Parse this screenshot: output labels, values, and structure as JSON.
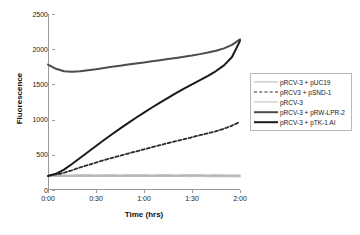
{
  "chart_data": {
    "type": "line",
    "title": "",
    "xlabel": "Time (hrs)",
    "ylabel": "Fluorescence",
    "xlim": [
      0,
      120
    ],
    "ylim": [
      0,
      2500
    ],
    "grid": false,
    "legend_position": "right",
    "xticks": [
      "0:00",
      "0:30",
      "1:00",
      "1:30",
      "2:00"
    ],
    "xtick_values": [
      0,
      30,
      60,
      90,
      120
    ],
    "yticks": [
      "0",
      "500",
      "1000",
      "1500",
      "2000",
      "2500"
    ],
    "ytick_values": [
      0,
      500,
      1000,
      1500,
      2000,
      2500
    ],
    "x": [
      0,
      5,
      10,
      15,
      20,
      25,
      30,
      35,
      40,
      45,
      50,
      55,
      60,
      65,
      70,
      75,
      80,
      85,
      90,
      95,
      100,
      105,
      110,
      115,
      120
    ],
    "series": [
      {
        "name": "pRCV-3 + pUC19",
        "color": "#b3b3b3",
        "style": "solid",
        "width": 1.6,
        "values": [
          205,
          208,
          210,
          209,
          211,
          212,
          210,
          211,
          212,
          210,
          211,
          212,
          211,
          210,
          212,
          211,
          210,
          211,
          212,
          211,
          210,
          211,
          210,
          209,
          208
        ]
      },
      {
        "name": "pRCV3 + pSND-1",
        "color": "#2b2b2b",
        "style": "dashed",
        "width": 1.8,
        "values": [
          200,
          218,
          245,
          280,
          320,
          355,
          390,
          425,
          455,
          487,
          518,
          548,
          578,
          608,
          637,
          666,
          694,
          722,
          750,
          778,
          806,
          835,
          870,
          915,
          968
        ]
      },
      {
        "name": "pRCV-3",
        "color": "#bdbdbd",
        "style": "solid",
        "width": 1.6,
        "values": [
          198,
          196,
          195,
          197,
          196,
          195,
          196,
          197,
          196,
          195,
          196,
          197,
          196,
          195,
          196,
          195,
          196,
          195,
          194,
          195,
          194,
          193,
          192,
          191,
          190
        ]
      },
      {
        "name": "pRCV-3 + pRW-LPR-2",
        "color": "#4d4d4d",
        "style": "solid",
        "width": 2.0,
        "values": [
          1782,
          1722,
          1686,
          1678,
          1686,
          1700,
          1716,
          1733,
          1750,
          1766,
          1782,
          1797,
          1812,
          1828,
          1844,
          1860,
          1876,
          1893,
          1910,
          1930,
          1952,
          1978,
          2012,
          2062,
          2140
        ]
      },
      {
        "name": "pRCV-3 + pTK-1 AI",
        "color": "#1a1a1a",
        "style": "solid",
        "width": 2.0,
        "values": [
          200,
          230,
          290,
          370,
          455,
          540,
          625,
          710,
          792,
          872,
          950,
          1026,
          1100,
          1172,
          1242,
          1310,
          1376,
          1440,
          1502,
          1562,
          1622,
          1690,
          1770,
          1890,
          2118
        ]
      }
    ]
  }
}
